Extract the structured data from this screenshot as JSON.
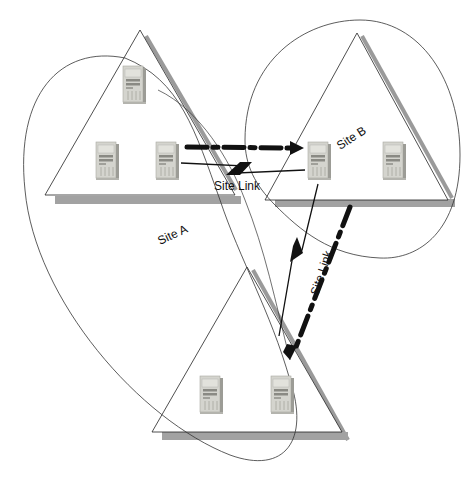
{
  "diagram": {
    "type": "network-site-topology",
    "colors": {
      "background": "#ffffff",
      "outline": "#222222",
      "shadow": "#9a9a9a",
      "server_body": "#cfcfc9",
      "server_dark": "#8c8c86",
      "arrow": "#111111"
    },
    "sites": [
      {
        "id": "site-a",
        "label": "Site A",
        "servers": 3
      },
      {
        "id": "site-b",
        "label": "Site B",
        "servers": 2
      },
      {
        "id": "site-c",
        "label": "",
        "servers": 2
      }
    ],
    "links": [
      {
        "from": "site-a",
        "to": "site-b",
        "label": "Site Link",
        "style": "zigzag"
      },
      {
        "from": "site-b",
        "to": "site-c",
        "label": "Site Link",
        "style": "zigzag"
      }
    ],
    "replication_arrows": [
      {
        "from": "site-a",
        "to": "site-b",
        "style": "dash-dot"
      },
      {
        "from": "site-b",
        "to": "site-c",
        "style": "dash-dot"
      }
    ],
    "labels": {
      "site_a": "Site A",
      "site_b": "Site B",
      "site_link_ab": "Site Link",
      "site_link_bc": "Site Link"
    }
  }
}
